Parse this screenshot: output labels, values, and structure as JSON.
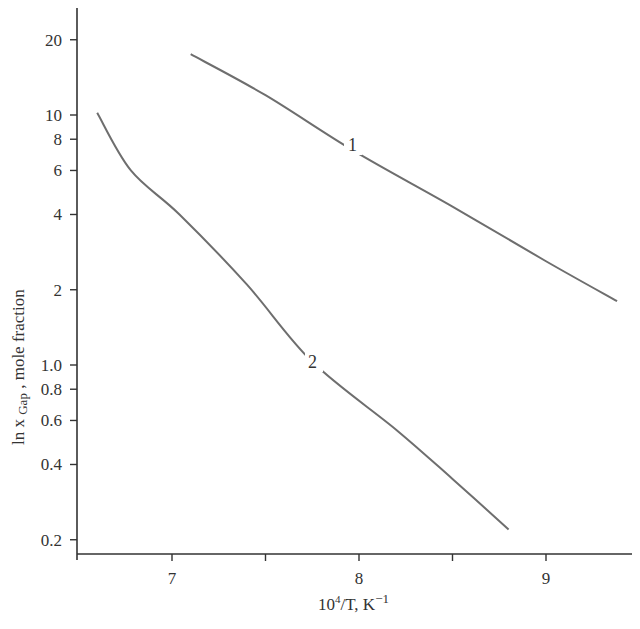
{
  "chart_data": {
    "type": "line",
    "title": "",
    "xlabel": "10^4/T, K^-1",
    "ylabel": "ln x GaP, mole fraction",
    "xlim": [
      6.0,
      9.45
    ],
    "ylim": [
      0.18,
      27
    ],
    "yscale": "log",
    "grid": false,
    "legend": "inline curve labels",
    "x_ticks": [
      7,
      7.5,
      8,
      8.5,
      9
    ],
    "x_tick_labels": [
      "7",
      "",
      "8",
      "",
      "9"
    ],
    "y_ticks": [
      20,
      10,
      8,
      6,
      4,
      2,
      1.0,
      0.8,
      0.6,
      0.4,
      0.2
    ],
    "y_tick_labels": [
      "20",
      "10",
      "8",
      "6",
      "4",
      "2",
      "1.0",
      "0.8",
      "0.6",
      "0.4",
      "0.2"
    ],
    "series": [
      {
        "name": "1",
        "x": [
          7.1,
          7.5,
          7.97,
          8.5,
          9.0,
          9.38
        ],
        "y": [
          17.5,
          12.0,
          7.2,
          4.3,
          2.6,
          1.8
        ]
      },
      {
        "name": "2",
        "x": [
          6.6,
          6.78,
          7.04,
          7.4,
          7.75,
          8.2,
          8.5,
          8.8
        ],
        "y": [
          10.2,
          6.0,
          4.0,
          2.1,
          1.03,
          0.55,
          0.35,
          0.22
        ]
      }
    ]
  },
  "axes": {
    "x_title_main": "10",
    "x_title_sup": "4",
    "x_title_rest": "/T, K",
    "x_title_sup2": "−1",
    "y_title_main": "ln x ",
    "y_title_sub": "Gap",
    "y_title_rest": " , mole fraction"
  },
  "labels": {
    "curve1": "1",
    "curve2": "2"
  },
  "colors": {
    "axis": "#333333",
    "curve": "#6e6e6e",
    "background": "#ffffff"
  }
}
